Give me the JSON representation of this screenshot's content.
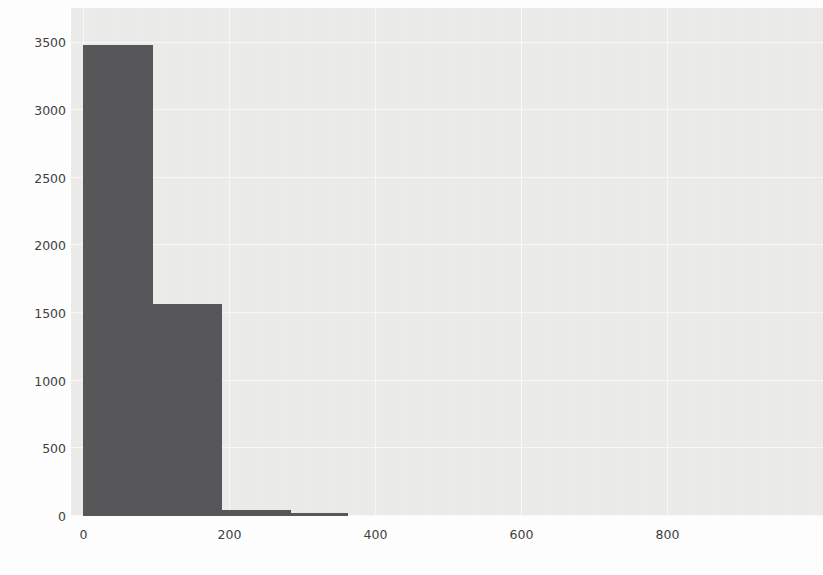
{
  "figure": {
    "background_color": "#ffffff",
    "plot_background_color": "#ececeb",
    "bar_color": "#58585a",
    "grid_color": "#f8f8f7",
    "tick_color": "#3f3f41"
  },
  "chart_data": {
    "type": "bar",
    "title": "",
    "xlabel": "",
    "ylabel": "",
    "grid": true,
    "legend": null,
    "xlim": [
      -17,
      1013
    ],
    "ylim": [
      0,
      3755
    ],
    "xticks": [
      "0",
      "200",
      "400",
      "600",
      "800"
    ],
    "xtick_values": [
      0,
      200,
      400,
      600,
      800
    ],
    "yticks": [
      "0",
      "500",
      "1000",
      "1500",
      "2000",
      "2500",
      "3000",
      "3500"
    ],
    "ytick_values": [
      0,
      500,
      1000,
      1500,
      2000,
      2500,
      3000,
      3500
    ],
    "bins": [
      {
        "x0": 0,
        "x1": 95,
        "value": 3480
      },
      {
        "x0": 95,
        "x1": 190,
        "value": 1570
      },
      {
        "x0": 190,
        "x1": 285,
        "value": 45
      },
      {
        "x0": 285,
        "x1": 363,
        "value": 20
      }
    ],
    "categories": [
      "0-95",
      "95-190",
      "190-285",
      "285-363"
    ],
    "values": [
      3480,
      1570,
      45,
      20
    ]
  },
  "background_document": {
    "note": "faint scanned page text showing through behind the plot",
    "lines": [
      {
        "text": "the beams",
        "x": 660,
        "y": 78,
        "size": 15
      },
      {
        "text": "in words. If a task is ambiguous, the model must",
        "x": 372,
        "y": 104,
        "size": 15
      },
      {
        "text": "an instruction between the two images and asks a single",
        "x": 196,
        "y": 152,
        "size": 15
      },
      {
        "text": "to train it towards a given response or an action",
        "x": 152,
        "y": 186,
        "size": 15
      },
      {
        "text": "we will use a short tutorial; the next we will build on",
        "x": 136,
        "y": 224,
        "size": 15
      },
      {
        "text": "and expert. The key",
        "x": 430,
        "y": 262,
        "size": 15
      },
      {
        "text": "3.2 Difference between Goal and Action Models",
        "x": 392,
        "y": 348,
        "size": 16
      },
      {
        "text": "In the general case, it is helpful to work with",
        "x": 410,
        "y": 402,
        "size": 15
      }
    ]
  }
}
